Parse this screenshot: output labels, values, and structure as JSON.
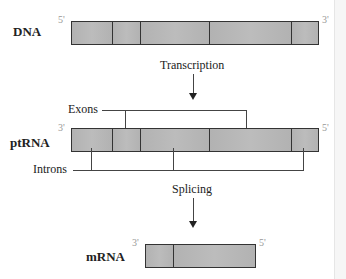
{
  "diagram": {
    "title": "",
    "dna": {
      "label": "DNA",
      "left_end": "5'",
      "right_end": "3'",
      "segments": [
        "intron",
        "exon",
        "intron",
        "exon",
        "intron"
      ]
    },
    "transcription": {
      "label": "Transcription"
    },
    "ptrna": {
      "label": "ptRNA",
      "left_end": "3'",
      "right_end": "5'",
      "segments": [
        "intron",
        "exon",
        "intron",
        "exon",
        "intron"
      ],
      "exons_label": "Exons",
      "introns_label": "Introns"
    },
    "splicing": {
      "label": "Splicing"
    },
    "mrna": {
      "label": "mRNA",
      "left_end": "3'",
      "right_end": "5'",
      "segments": [
        "exon",
        "exon"
      ]
    }
  },
  "colors": {
    "segment_fill": "#b5b5b5",
    "outline": "#333333",
    "prime_text": "#999999"
  }
}
